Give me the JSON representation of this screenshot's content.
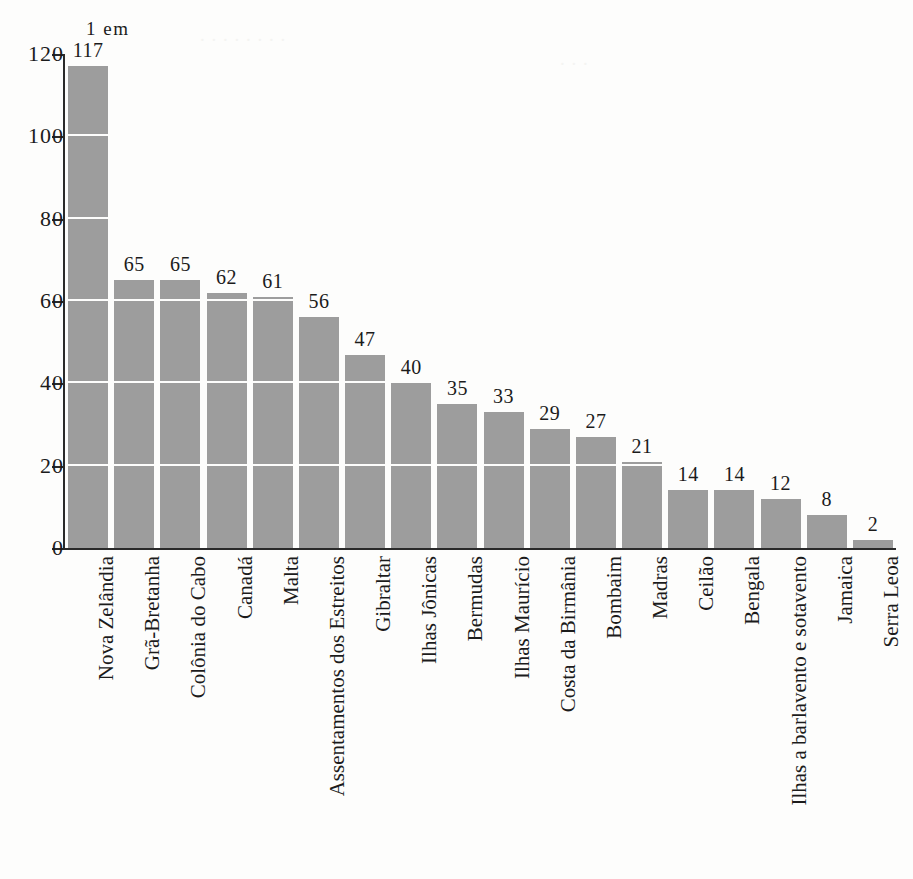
{
  "unit_note": "1 em",
  "chart_data": {
    "type": "bar",
    "title": "",
    "subtitle": "",
    "xlabel": "",
    "ylabel": "",
    "unit_annotation": "1 em",
    "ylim": [
      0,
      120
    ],
    "yticks": [
      0,
      20,
      40,
      60,
      80,
      100,
      120
    ],
    "ytick_labels": [
      "0",
      "20",
      "40",
      "60",
      "80",
      "100",
      "120"
    ],
    "grid": "horizontal-white-over-bars",
    "legend": "none",
    "bar_color": "#9d9d9d",
    "axis_color": "#2a2a2a",
    "gridline_color": "#fdfdfc",
    "categories": [
      "Nova Zelândia",
      "Grã-Bretanha",
      "Colônia do Cabo",
      "Canadá",
      "Malta",
      "Assentamentos dos Estreitos",
      "Gibraltar",
      "Ilhas Jônicas",
      "Bermudas",
      "Ilhas Maurício",
      "Costa da Birmânia",
      "Bombaim",
      "Madras",
      "Ceilão",
      "Bengala",
      "Ilhas a barlavento e sotavento",
      "Jamaica",
      "Serra Leoa"
    ],
    "values": [
      117,
      65,
      65,
      62,
      61,
      56,
      47,
      40,
      35,
      33,
      29,
      27,
      21,
      14,
      14,
      12,
      8,
      2
    ],
    "value_labels": [
      "117",
      "65",
      "65",
      "62",
      "61",
      "56",
      "47",
      "40",
      "35",
      "33",
      "29",
      "27",
      "21",
      "14",
      "14",
      "12",
      "8",
      "2"
    ]
  }
}
